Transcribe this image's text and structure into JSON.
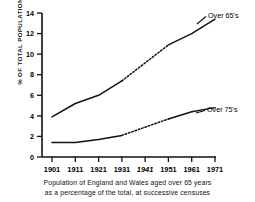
{
  "chart_data": {
    "type": "line",
    "title": "",
    "xlabel": "",
    "ylabel": "% OF TOTAL POPULATION",
    "x": [
      "1901",
      "1911",
      "1921",
      "1931",
      "1941",
      "1951",
      "1961",
      "1971"
    ],
    "xtick_labels": [
      "1901",
      "1911",
      "1921",
      "1931",
      "1941",
      "1951",
      "1961",
      "1971"
    ],
    "xtick_styles": [
      "normal",
      "normal",
      "normal",
      "normal",
      "italic",
      "normal",
      "normal",
      "normal"
    ],
    "ytick_labels": [
      "0",
      "2",
      "4",
      "6",
      "8",
      "10",
      "12",
      "14"
    ],
    "ytick_values": [
      0,
      2,
      4,
      6,
      8,
      10,
      12,
      14
    ],
    "ylim": [
      0,
      14
    ],
    "grid": false,
    "legend_position": "inline-right",
    "series": [
      {
        "name": "Over 65's",
        "label": "Over 65's",
        "color": "#111111",
        "values": [
          3.9,
          5.2,
          6.0,
          7.4,
          null,
          10.9,
          12.0,
          13.4
        ],
        "dashed_segment": {
          "from": "1931",
          "to": "1951",
          "reason": "no 1941 census"
        }
      },
      {
        "name": "Over 75's",
        "label": "Over 75's",
        "color": "#111111",
        "values": [
          1.4,
          1.4,
          1.7,
          2.1,
          null,
          3.7,
          4.4,
          4.8
        ],
        "dashed_segment": {
          "from": "1931",
          "to": "1951",
          "reason": "no 1941 census"
        }
      }
    ]
  },
  "labels": {
    "series_65": "Over 65's",
    "series_75": "Over 75's",
    "yaxis": "% OF TOTAL POPULATION",
    "y0": "0",
    "y2": "2",
    "y4": "4",
    "y6": "6",
    "y8": "8",
    "y10": "10",
    "y12": "12",
    "y14": "14",
    "x1901": "1901",
    "x1911": "1911",
    "x1921": "1921",
    "x1931": "1931",
    "x1941": "1941",
    "x1951": "1951",
    "x1961": "1961",
    "x1971": "1971"
  },
  "caption": {
    "line1": "Population of England and Wales aged over 65 years",
    "line2": "as a percentage of the total, at successive censuses"
  }
}
